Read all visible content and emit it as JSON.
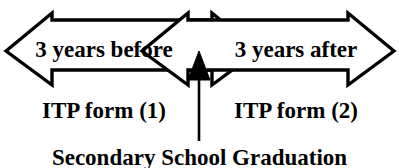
{
  "diagram": {
    "type": "timeline-double-arrow",
    "stroke_color": "#000000",
    "fill_color": "#ffffff",
    "left_arrow": {
      "direction": "left",
      "period_label": "3 years before",
      "form_label": "ITP form (1)"
    },
    "right_arrow": {
      "direction": "right",
      "period_label": "3 years after",
      "form_label": "ITP form (2)"
    },
    "center_marker": {
      "icon": "up-arrow-icon",
      "caption": "Secondary School Graduation"
    }
  }
}
